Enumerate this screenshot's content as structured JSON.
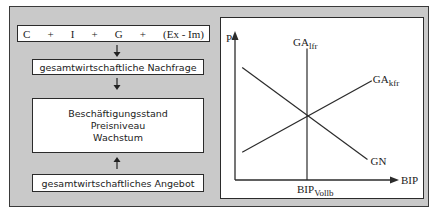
{
  "left_flow": {
    "formula_terms": [
      "C",
      "+",
      "I",
      "+",
      "G",
      "+",
      "(Ex - Im)"
    ],
    "demand_label": "gesamtwirtschaftliche Nachfrage",
    "targets": [
      "Beschäftigungsstand",
      "Preisniveau",
      "Wachstum"
    ],
    "supply_label": "gesamtwirtschaftliches Angebot",
    "arrows": [
      "down",
      "down",
      "up"
    ]
  },
  "chart_data": {
    "type": "line",
    "title": "",
    "xlabel": "BIP",
    "ylabel": "P",
    "x_tick_labels": [
      {
        "main": "BIP",
        "sub": "Vollb"
      }
    ],
    "series": [
      {
        "name": "GA_lfr",
        "label_main": "GA",
        "label_sub": "lfr",
        "shape": "vertical",
        "points": [
          [
            0.5,
            0.0
          ],
          [
            0.5,
            0.9
          ]
        ]
      },
      {
        "name": "GA_kfr",
        "label_main": "GA",
        "label_sub": "kfr",
        "shape": "upward-sloping",
        "points": [
          [
            0.05,
            0.19
          ],
          [
            0.95,
            0.68
          ]
        ]
      },
      {
        "name": "GN",
        "label_main": "GN",
        "label_sub": "",
        "shape": "downward-sloping",
        "points": [
          [
            0.05,
            0.77
          ],
          [
            0.92,
            0.14
          ]
        ]
      }
    ],
    "equilibrium": [
      0.5,
      0.44
    ],
    "xlim": [
      0,
      1
    ],
    "ylim": [
      0,
      1
    ],
    "grid": false,
    "legend": "none"
  },
  "colors": {
    "panel_bg": "#c9c9c9",
    "box_bg": "#ffffff",
    "line": "#2b2b2b"
  }
}
